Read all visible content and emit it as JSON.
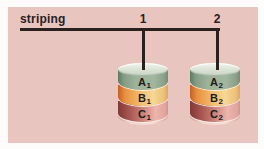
{
  "figure": {
    "label": "striping",
    "branches": [
      {
        "number": "1"
      },
      {
        "number": "2"
      }
    ],
    "disks": [
      {
        "id": "disk-1",
        "branch": "1",
        "bands": [
          {
            "letter": "A",
            "sub": "1"
          },
          {
            "letter": "B",
            "sub": "1"
          },
          {
            "letter": "C",
            "sub": "1"
          }
        ]
      },
      {
        "id": "disk-2",
        "branch": "2",
        "bands": [
          {
            "letter": "A",
            "sub": "2"
          },
          {
            "letter": "B",
            "sub": "2"
          },
          {
            "letter": "C",
            "sub": "2"
          }
        ]
      }
    ]
  },
  "colors": {
    "panel_bg": "#e8c6bf",
    "line": "#2a211e",
    "stripe_a_green": "#9db29a",
    "stripe_b_orange": "#e8913f",
    "stripe_b_yellow": "#f7d795",
    "stripe_c_red": "#9c4a46",
    "stripe_c_pink": "#edb5ad",
    "cylinder_top": "#dde4d7",
    "cylinder_bottom": "#f3d5cd"
  }
}
